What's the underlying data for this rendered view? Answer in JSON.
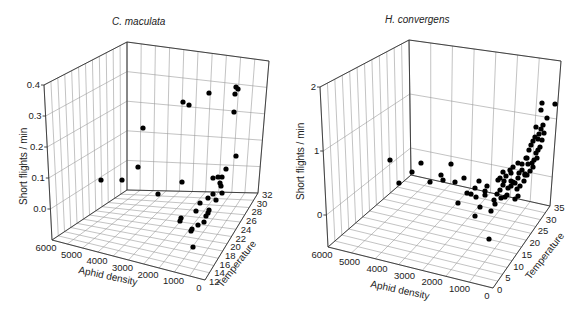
{
  "chart_data": [
    {
      "type": "scatter3d",
      "title": "C. maculata",
      "xlabel": "Aphid density",
      "ylabel": "Temperature",
      "zlabel": "Short flights / min",
      "x_ticks": [
        "6000",
        "5000",
        "4000",
        "3000",
        "2000",
        "1000",
        "0"
      ],
      "y_ticks": [
        "12",
        "14",
        "16",
        "18",
        "20",
        "22",
        "24",
        "26",
        "28",
        "30",
        "32"
      ],
      "z_ticks": [
        "0.0",
        "0.1",
        "0.2",
        "0.3",
        "0.4"
      ],
      "xlim": [
        6000,
        0
      ],
      "ylim": [
        12,
        32
      ],
      "zlim": [
        -0.05,
        0.4
      ],
      "grid": true,
      "frame": {
        "back_top": [
          127,
          42
        ],
        "back_bottom": [
          127,
          190
        ],
        "left_top": [
          44,
          85
        ],
        "left_bottom": [
          52,
          240
        ],
        "right_top": [
          269,
          61
        ],
        "right_bottom": [
          258,
          193
        ],
        "front_bottom": [
          205,
          280
        ]
      },
      "points_px": [
        [
          101,
          180
        ],
        [
          122,
          180
        ],
        [
          138,
          167
        ],
        [
          158,
          194
        ],
        [
          182,
          182
        ],
        [
          143,
          128
        ],
        [
          183,
          102
        ],
        [
          189,
          105
        ],
        [
          209,
          93
        ],
        [
          235,
          94
        ],
        [
          236,
          87
        ],
        [
          238,
          89
        ],
        [
          234,
          112
        ],
        [
          236,
          156
        ],
        [
          226,
          169
        ],
        [
          213,
          178
        ],
        [
          218,
          177
        ],
        [
          222,
          177
        ],
        [
          220,
          183
        ],
        [
          221,
          186
        ],
        [
          213,
          194
        ],
        [
          222,
          193
        ],
        [
          216,
          200
        ],
        [
          208,
          198
        ],
        [
          200,
          203
        ],
        [
          196,
          211
        ],
        [
          209,
          210
        ],
        [
          208,
          213
        ],
        [
          206,
          216
        ],
        [
          204,
          222
        ],
        [
          198,
          225
        ],
        [
          192,
          229
        ],
        [
          191,
          231
        ],
        [
          180,
          221
        ],
        [
          181,
          218
        ],
        [
          193,
          247
        ]
      ]
    },
    {
      "type": "scatter3d",
      "title": "H. convergens",
      "xlabel": "Aphid density",
      "ylabel": "Temperature",
      "zlabel": "Short flights / min",
      "x_ticks": [
        "6000",
        "5000",
        "4000",
        "3000",
        "2000",
        "1000",
        "0"
      ],
      "y_ticks": [
        "0",
        "5",
        "10",
        "15",
        "20",
        "25",
        "30",
        "35"
      ],
      "z_ticks": [
        "0",
        "1",
        "2"
      ],
      "xlim": [
        6000,
        0
      ],
      "ylim": [
        0,
        35
      ],
      "zlim": [
        -0.5,
        2
      ],
      "grid": true,
      "frame": {
        "back_top": [
          409,
          40
        ],
        "back_bottom": [
          411,
          175
        ],
        "left_top": [
          320,
          87
        ],
        "left_bottom": [
          328,
          247
        ],
        "right_top": [
          561,
          61
        ],
        "right_bottom": [
          550,
          206
        ],
        "front_bottom": [
          493,
          288
        ]
      },
      "points_px": [
        [
          390,
          160
        ],
        [
          399,
          183
        ],
        [
          412,
          172
        ],
        [
          421,
          163
        ],
        [
          430,
          182
        ],
        [
          441,
          175
        ],
        [
          443,
          180
        ],
        [
          451,
          164
        ],
        [
          455,
          182
        ],
        [
          464,
          178
        ],
        [
          467,
          193
        ],
        [
          458,
          203
        ],
        [
          475,
          188
        ],
        [
          479,
          181
        ],
        [
          471,
          194
        ],
        [
          476,
          197
        ],
        [
          485,
          191
        ],
        [
          487,
          186
        ],
        [
          500,
          178
        ],
        [
          491,
          211
        ],
        [
          501,
          198
        ],
        [
          508,
          188
        ],
        [
          511,
          181
        ],
        [
          515,
          183
        ],
        [
          518,
          178
        ],
        [
          519,
          173
        ],
        [
          522,
          170
        ],
        [
          525,
          174
        ],
        [
          528,
          164
        ],
        [
          527,
          158
        ],
        [
          529,
          150
        ],
        [
          531,
          145
        ],
        [
          533,
          141
        ],
        [
          535,
          137
        ],
        [
          536,
          153
        ],
        [
          536,
          127
        ],
        [
          538,
          139
        ],
        [
          539,
          134
        ],
        [
          541,
          129
        ],
        [
          538,
          150
        ],
        [
          532,
          163
        ],
        [
          526,
          158
        ],
        [
          522,
          164
        ],
        [
          518,
          163
        ],
        [
          513,
          167
        ],
        [
          511,
          173
        ],
        [
          506,
          176
        ],
        [
          504,
          181
        ],
        [
          503,
          185
        ],
        [
          500,
          190
        ],
        [
          497,
          194
        ],
        [
          494,
          200
        ],
        [
          495,
          204
        ],
        [
          505,
          197
        ],
        [
          507,
          195
        ],
        [
          511,
          186
        ],
        [
          513,
          182
        ],
        [
          517,
          189
        ],
        [
          520,
          186
        ],
        [
          524,
          181
        ],
        [
          527,
          175
        ],
        [
          530,
          171
        ],
        [
          533,
          167
        ],
        [
          534,
          160
        ],
        [
          537,
          158
        ],
        [
          540,
          147
        ],
        [
          542,
          140
        ],
        [
          544,
          133
        ],
        [
          543,
          125
        ],
        [
          547,
          118
        ],
        [
          541,
          110
        ],
        [
          542,
          103
        ],
        [
          485,
          195
        ],
        [
          480,
          207
        ],
        [
          475,
          216
        ],
        [
          525,
          175
        ],
        [
          489,
          239
        ],
        [
          555,
          104
        ],
        [
          498,
          180
        ],
        [
          503,
          172
        ],
        [
          510,
          170
        ],
        [
          518,
          196
        ],
        [
          515,
          199
        ]
      ]
    }
  ]
}
